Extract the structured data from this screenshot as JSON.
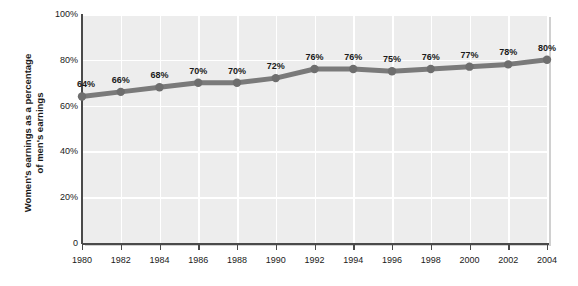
{
  "chart_data": {
    "type": "line",
    "title": "",
    "xlabel": "",
    "ylabel": "Women's earnings as a percentage of men's earnings",
    "ylabel_lines": [
      "Women's earnings as a percentage",
      "of men's earnings"
    ],
    "categories": [
      "1980",
      "1982",
      "1984",
      "1986",
      "1988",
      "1990",
      "1992",
      "1994",
      "1996",
      "1998",
      "2000",
      "2002",
      "2004"
    ],
    "values": [
      64,
      66,
      68,
      70,
      70,
      72,
      76,
      76,
      75,
      76,
      77,
      78,
      80
    ],
    "point_labels": [
      "64%",
      "66%",
      "68%",
      "70%",
      "70%",
      "72%",
      "76%",
      "76%",
      "75%",
      "76%",
      "77%",
      "78%",
      "80%"
    ],
    "ylim": [
      0,
      100
    ],
    "y_ticks": [
      0,
      20,
      40,
      60,
      80,
      100
    ],
    "y_tick_labels": [
      "0",
      "20%",
      "40%",
      "60%",
      "80%",
      "100%"
    ],
    "grid": true,
    "legend": "none",
    "colors": {
      "line": "#7a7a7a",
      "marker": "#6e6e6e",
      "plot_background": "#ededed",
      "gridline": "#ffffff",
      "axis": "#4a4a4a",
      "text": "#1a1a1a",
      "page_background": "#ffffff"
    }
  }
}
